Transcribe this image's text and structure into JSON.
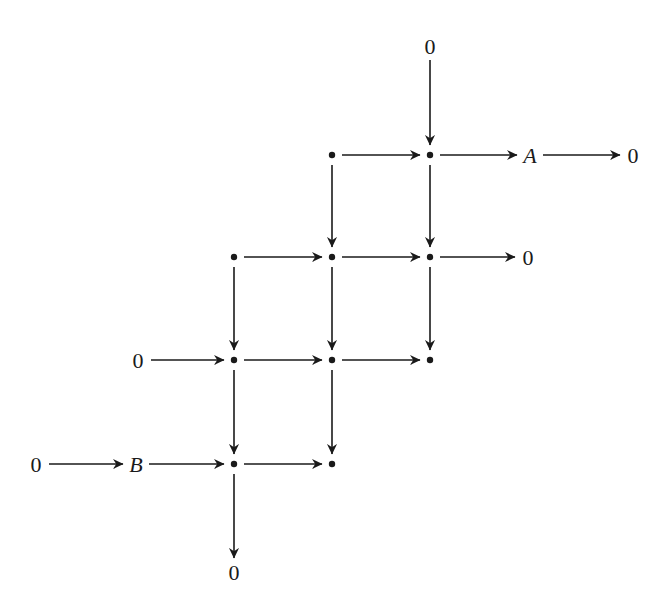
{
  "diagram": {
    "type": "commutative-diagram",
    "colors": {
      "ink": "#1a1a1a",
      "background": "#ffffff"
    },
    "nodes": [
      {
        "id": "z_top",
        "label": "0",
        "x": 430,
        "y": 46,
        "kind": "text"
      },
      {
        "id": "r1c2",
        "label": "•",
        "x": 332,
        "y": 155,
        "kind": "dot"
      },
      {
        "id": "r1c3",
        "label": "•",
        "x": 430,
        "y": 155,
        "kind": "dot"
      },
      {
        "id": "A",
        "label": "A",
        "x": 530,
        "y": 155,
        "kind": "text",
        "italic": true
      },
      {
        "id": "z_A",
        "label": "0",
        "x": 633,
        "y": 155,
        "kind": "text"
      },
      {
        "id": "r2c1",
        "label": "•",
        "x": 234,
        "y": 257,
        "kind": "dot"
      },
      {
        "id": "r2c2",
        "label": "•",
        "x": 332,
        "y": 257,
        "kind": "dot"
      },
      {
        "id": "r2c3",
        "label": "•",
        "x": 430,
        "y": 257,
        "kind": "dot"
      },
      {
        "id": "z_r2",
        "label": "0",
        "x": 528,
        "y": 257,
        "kind": "text"
      },
      {
        "id": "z_r3",
        "label": "0",
        "x": 138,
        "y": 360,
        "kind": "text"
      },
      {
        "id": "r3c1",
        "label": "•",
        "x": 234,
        "y": 360,
        "kind": "dot"
      },
      {
        "id": "r3c2",
        "label": "•",
        "x": 332,
        "y": 360,
        "kind": "dot"
      },
      {
        "id": "r3c3",
        "label": "•",
        "x": 430,
        "y": 360,
        "kind": "dot"
      },
      {
        "id": "z_B",
        "label": "0",
        "x": 36,
        "y": 464,
        "kind": "text"
      },
      {
        "id": "B",
        "label": "B",
        "x": 136,
        "y": 464,
        "kind": "text",
        "italic": true
      },
      {
        "id": "r4c1",
        "label": "•",
        "x": 234,
        "y": 464,
        "kind": "dot"
      },
      {
        "id": "r4c2",
        "label": "•",
        "x": 332,
        "y": 464,
        "kind": "dot"
      },
      {
        "id": "z_bottom",
        "label": "0",
        "x": 234,
        "y": 572,
        "kind": "text"
      }
    ],
    "edges": [
      {
        "from": "z_top",
        "to": "r1c3"
      },
      {
        "from": "r1c2",
        "to": "r1c3"
      },
      {
        "from": "r1c3",
        "to": "A"
      },
      {
        "from": "A",
        "to": "z_A"
      },
      {
        "from": "r1c2",
        "to": "r2c2"
      },
      {
        "from": "r1c3",
        "to": "r2c3"
      },
      {
        "from": "r2c1",
        "to": "r2c2"
      },
      {
        "from": "r2c2",
        "to": "r2c3"
      },
      {
        "from": "r2c3",
        "to": "z_r2"
      },
      {
        "from": "r2c1",
        "to": "r3c1"
      },
      {
        "from": "r2c2",
        "to": "r3c2"
      },
      {
        "from": "r2c3",
        "to": "r3c3"
      },
      {
        "from": "z_r3",
        "to": "r3c1"
      },
      {
        "from": "r3c1",
        "to": "r3c2"
      },
      {
        "from": "r3c2",
        "to": "r3c3"
      },
      {
        "from": "r3c1",
        "to": "r4c1"
      },
      {
        "from": "r3c2",
        "to": "r4c2"
      },
      {
        "from": "z_B",
        "to": "B"
      },
      {
        "from": "B",
        "to": "r4c1"
      },
      {
        "from": "r4c1",
        "to": "r4c2"
      },
      {
        "from": "r4c1",
        "to": "z_bottom"
      }
    ]
  }
}
